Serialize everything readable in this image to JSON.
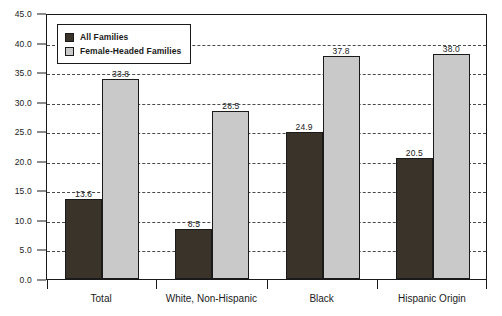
{
  "chart_data": {
    "type": "bar",
    "title": "",
    "subtitle": "",
    "xlabel": "",
    "ylabel": "",
    "categories": [
      "Total",
      "White, Non-Hispanic",
      "Black",
      "Hispanic Origin"
    ],
    "series": [
      {
        "name": "All Families",
        "color": "#3a3329",
        "values": [
          13.6,
          8.5,
          24.9,
          20.5
        ]
      },
      {
        "name": "Female-Headed Families",
        "color": "#c9c9c9",
        "values": [
          33.8,
          28.5,
          37.8,
          38.0
        ]
      }
    ],
    "value_labels": [
      [
        "13.6",
        "8.5",
        "24.9",
        "20.5"
      ],
      [
        "33.8",
        "28.5",
        "37.8",
        "38.0"
      ]
    ],
    "ylim": [
      0.0,
      45.0
    ],
    "ytick_values": [
      0.0,
      5.0,
      10.0,
      15.0,
      20.0,
      25.0,
      30.0,
      35.0,
      40.0,
      45.0
    ],
    "ytick_labels": [
      "0.0",
      "5.0",
      "10.0",
      "15.0",
      "20.0",
      "25.0",
      "30.0",
      "35.0",
      "40.0",
      "45.0"
    ],
    "grid": true,
    "grid_style": "dashed",
    "grid_axis": "y",
    "legend_position": "top-left",
    "frame": true,
    "colors": {
      "axis": "#1a1a1a",
      "grid": "#4a4a4a",
      "background": "#ffffff",
      "series_all_families": "#3a3329",
      "series_female_headed_families": "#c9c9c9"
    }
  },
  "legend": {
    "entries": [
      {
        "label": "All Families"
      },
      {
        "label": "Female-Headed Families"
      }
    ]
  }
}
